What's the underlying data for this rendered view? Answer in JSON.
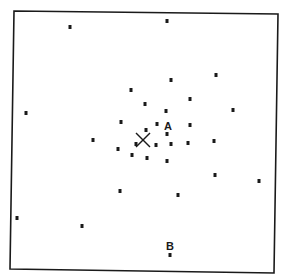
{
  "figure": {
    "type": "scatter-point-diagram",
    "colors": {
      "ink": "#1a1a1a",
      "background": "#ffffff"
    },
    "center_marker": {
      "symbol": "X",
      "position": [
        143,
        140
      ]
    },
    "labeled_points": [
      {
        "label": "A",
        "position": [
          167,
          134
        ]
      },
      {
        "label": "B",
        "position": [
          170,
          255
        ]
      }
    ],
    "points": [
      [
        70,
        27
      ],
      [
        167,
        21
      ],
      [
        26,
        113
      ],
      [
        216,
        75
      ],
      [
        171,
        80
      ],
      [
        131,
        90
      ],
      [
        190,
        99
      ],
      [
        145,
        104
      ],
      [
        166,
        111
      ],
      [
        233,
        110
      ],
      [
        121,
        122
      ],
      [
        157,
        124
      ],
      [
        190,
        125
      ],
      [
        146,
        130
      ],
      [
        93,
        140
      ],
      [
        136,
        144
      ],
      [
        156,
        145
      ],
      [
        171,
        144
      ],
      [
        188,
        143
      ],
      [
        214,
        141
      ],
      [
        118,
        149
      ],
      [
        132,
        155
      ],
      [
        147,
        158
      ],
      [
        167,
        161
      ],
      [
        215,
        175
      ],
      [
        259,
        181
      ],
      [
        120,
        191
      ],
      [
        178,
        195
      ],
      [
        17,
        218
      ],
      [
        82,
        226
      ]
    ]
  }
}
